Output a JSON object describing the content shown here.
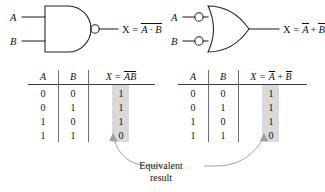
{
  "figure": {
    "type": "logic-gate-equivalence-diagram",
    "caption": {
      "line1": "Equivalent",
      "line2": "result"
    }
  },
  "gates": {
    "left": {
      "name": "nand-gate",
      "inputs": [
        "A",
        "B"
      ],
      "output_label": {
        "prefix": "X =",
        "barred": "A · B"
      },
      "output_plain": "X = Ā·B̄"
    },
    "right": {
      "name": "negative-or-gate",
      "inputs": [
        "A",
        "B"
      ],
      "output_label": {
        "prefix": "X =",
        "term1": "A",
        "op": "+",
        "term2": "B"
      },
      "output_plain": "X = Ā + B̄"
    }
  },
  "tables": [
    {
      "id": "left-truth-table",
      "headers": {
        "a": "A",
        "b": "B",
        "x_prefix": "X =",
        "x_barred": "AB"
      },
      "rows": [
        {
          "a": "0",
          "b": "0",
          "x": "1"
        },
        {
          "a": "0",
          "b": "1",
          "x": "1"
        },
        {
          "a": "1",
          "b": "0",
          "x": "1"
        },
        {
          "a": "1",
          "b": "1",
          "x": "0"
        }
      ]
    },
    {
      "id": "right-truth-table",
      "headers": {
        "a": "A",
        "b": "B",
        "x_prefix": "X =",
        "x_term1": "A",
        "x_op": "+",
        "x_term2": "B"
      },
      "rows": [
        {
          "a": "0",
          "b": "0",
          "x": "1"
        },
        {
          "a": "0",
          "b": "1",
          "x": "1"
        },
        {
          "a": "1",
          "b": "0",
          "x": "1"
        },
        {
          "a": "1",
          "b": "1",
          "x": "0"
        }
      ]
    }
  ],
  "colors": {
    "highlight": "#d9d9d9",
    "line": "#222222",
    "rule": "#3a3a3a",
    "text": "#111111",
    "arrow": "#9a9a9a",
    "background": "#ffffff"
  }
}
